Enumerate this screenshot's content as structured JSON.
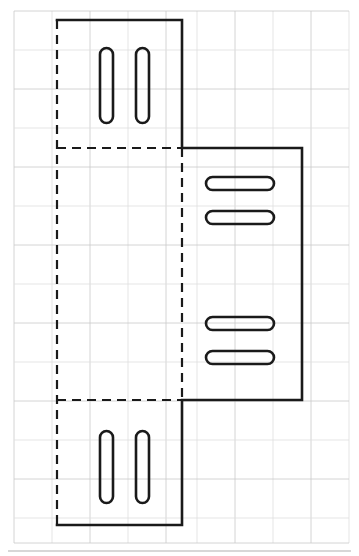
{
  "document": {
    "type": "engineering-drawing",
    "title": "Sheet metal bracket flat pattern layout",
    "background_color": "#ffffff",
    "outline_color": "#1a1a1a",
    "grid_color": "#c9c9c9",
    "grid_color_faint": "#dedede",
    "border_color": "#b0b0b0"
  },
  "grid": {
    "visible": true,
    "x_lines": [
      14,
      52,
      90,
      128,
      166,
      197,
      235,
      273,
      311,
      349
    ],
    "y_lines": [
      11,
      50,
      89,
      128,
      167,
      206,
      245,
      284,
      323,
      362,
      401,
      440,
      479,
      518,
      543
    ],
    "stroke_width": 0.8
  },
  "border": {
    "bottom_rule_y": 551,
    "x_start": 8,
    "x_end": 351,
    "stroke_width": 1.2
  },
  "profile": {
    "name": "visible-outline",
    "line_style": "solid",
    "stroke_width": 2.6,
    "points": [
      [
        57,
        20
      ],
      [
        182,
        20
      ],
      [
        182,
        148
      ],
      [
        302,
        148
      ],
      [
        302,
        400
      ],
      [
        182,
        400
      ],
      [
        182,
        525
      ],
      [
        57,
        525
      ]
    ]
  },
  "hidden_edges": {
    "name": "hidden-bend-lines",
    "line_style": "dashed",
    "stroke_width": 2.2,
    "dash_pattern": "9 6",
    "segments": [
      {
        "id": "left-vertical",
        "x1": 57,
        "y1": 20,
        "x2": 57,
        "y2": 525
      },
      {
        "id": "upper-horizontal",
        "x1": 57,
        "y1": 148,
        "x2": 182,
        "y2": 148
      },
      {
        "id": "middle-vertical",
        "x1": 182,
        "y1": 148,
        "x2": 182,
        "y2": 400
      },
      {
        "id": "lower-horizontal",
        "x1": 57,
        "y1": 400,
        "x2": 182,
        "y2": 400
      }
    ]
  },
  "slots": {
    "stroke_width": 2.6,
    "fill": "none",
    "items": [
      {
        "id": "slot-top-left",
        "orientation": "vertical",
        "x": 100,
        "y": 48,
        "width": 13,
        "height": 75,
        "radius": 6.5
      },
      {
        "id": "slot-top-right",
        "orientation": "vertical",
        "x": 136,
        "y": 48,
        "width": 13,
        "height": 75,
        "radius": 6.5
      },
      {
        "id": "slot-mid-upper-1",
        "orientation": "horizontal",
        "x": 206,
        "y": 177,
        "width": 68,
        "height": 13,
        "radius": 6.5
      },
      {
        "id": "slot-mid-upper-2",
        "orientation": "horizontal",
        "x": 206,
        "y": 211,
        "width": 68,
        "height": 13,
        "radius": 6.5
      },
      {
        "id": "slot-mid-lower-1",
        "orientation": "horizontal",
        "x": 206,
        "y": 317,
        "width": 68,
        "height": 13,
        "radius": 6.5
      },
      {
        "id": "slot-mid-lower-2",
        "orientation": "horizontal",
        "x": 206,
        "y": 351,
        "width": 68,
        "height": 13,
        "radius": 6.5
      },
      {
        "id": "slot-bottom-left",
        "orientation": "vertical",
        "x": 100,
        "y": 431,
        "width": 13,
        "height": 72,
        "radius": 6.5
      },
      {
        "id": "slot-bottom-right",
        "orientation": "vertical",
        "x": 136,
        "y": 431,
        "width": 13,
        "height": 72,
        "radius": 6.5
      }
    ]
  }
}
